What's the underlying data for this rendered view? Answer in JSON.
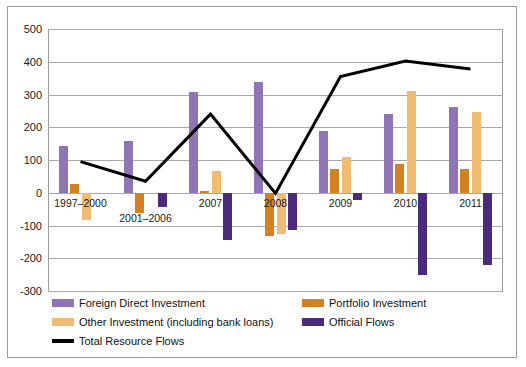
{
  "chart_data": {
    "type": "bar",
    "title": "",
    "xlabel": "",
    "ylabel": "",
    "ylim": [
      -300,
      500
    ],
    "ytick_step": 100,
    "yticks": [
      500,
      400,
      300,
      200,
      100,
      0,
      -100,
      -200,
      -300
    ],
    "ytick_labels": [
      "500",
      "400",
      "300",
      "200",
      "100",
      "0",
      "-100",
      "-200",
      "-300"
    ],
    "grid": true,
    "legend_position": "bottom-left",
    "categories": [
      "1997–2000",
      "2001–2006",
      "2007",
      "2008",
      "2009",
      "2010",
      "2011"
    ],
    "series": [
      {
        "name": "Foreign Direct Investment",
        "kind": "bar",
        "color": "#8f75b5",
        "values": [
          144,
          159,
          308,
          338,
          188,
          240,
          262
        ]
      },
      {
        "name": "Portfolio Investment",
        "kind": "bar",
        "color": "#d4821f",
        "values": [
          28,
          -62,
          5,
          -132,
          73,
          88,
          73
        ]
      },
      {
        "name": "Other Investment (including bank loans)",
        "kind": "bar",
        "color": "#f0bc71",
        "values": [
          -84,
          0,
          65,
          -125,
          110,
          310,
          248
        ]
      },
      {
        "name": "Official Flows",
        "kind": "bar",
        "color": "#4b2a7b",
        "values": [
          0,
          -42,
          -145,
          -115,
          -23,
          -252,
          -220
        ]
      },
      {
        "name": "Total Resource Flows",
        "kind": "line",
        "color": "#000000",
        "values": [
          95,
          35,
          240,
          -2,
          355,
          402,
          378
        ]
      }
    ]
  },
  "legend": {
    "rows": [
      [
        {
          "label": "Foreign Direct Investment",
          "color": "#8f75b5",
          "kind": "bar"
        },
        {
          "label": "Portfolio Investment",
          "color": "#d4821f",
          "kind": "bar"
        }
      ],
      [
        {
          "label": "Other Investment (including bank loans)",
          "color": "#f0bc71",
          "kind": "bar"
        },
        {
          "label": "Official Flows",
          "color": "#4b2a7b",
          "kind": "bar"
        }
      ],
      [
        {
          "label": "Total Resource Flows",
          "color": "#000000",
          "kind": "line"
        }
      ]
    ]
  }
}
